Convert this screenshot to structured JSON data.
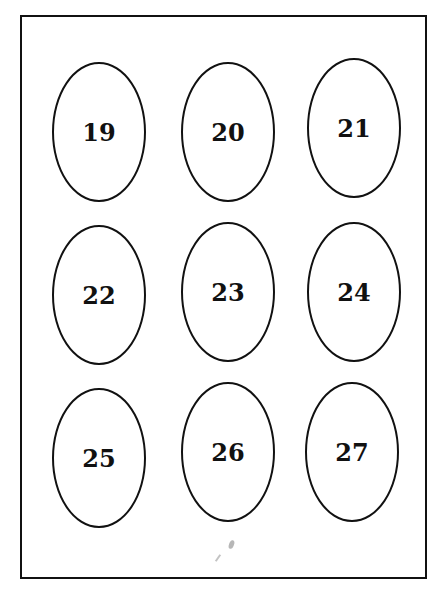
{
  "labels": {
    "r0c0": "19",
    "r0c1": "20",
    "r0c2": "21",
    "r1c0": "22",
    "r1c1": "23",
    "r1c2": "24",
    "r2c0": "25",
    "r2c1": "26",
    "r2c2": "27"
  }
}
